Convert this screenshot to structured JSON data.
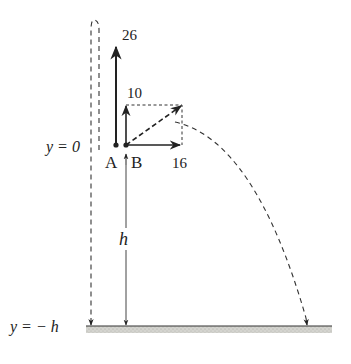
{
  "diagram": {
    "type": "projectile-motion",
    "labels": {
      "y_zero": "y = 0",
      "y_minus_h": "y = − h",
      "point_a": "A",
      "point_b": "B",
      "height": "h"
    },
    "vectors": {
      "a_vertical": "26",
      "b_vertical": "10",
      "b_horizontal": "16"
    },
    "colors": {
      "ink": "#222222",
      "ground": "#c8c8c2"
    }
  }
}
